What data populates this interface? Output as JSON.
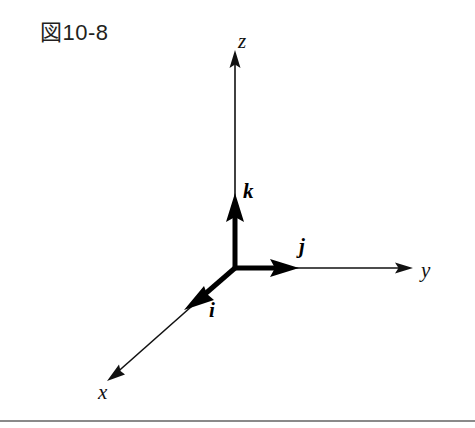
{
  "figure": {
    "caption": "図10-8",
    "background_color": "#ffffff",
    "ink_color": "#111111",
    "caption_color": "#231f20",
    "rule_color": "#8a8a8a"
  },
  "diagram": {
    "type": "3d-coordinate-axes",
    "origin": {
      "x": 235,
      "y": 268
    },
    "axes": [
      {
        "id": "z",
        "label": "z",
        "label_position": {
          "x": 238,
          "y": 48
        },
        "tip": {
          "x": 235,
          "y": 50
        },
        "direction": "up"
      },
      {
        "id": "y",
        "label": "y",
        "label_position": {
          "x": 421,
          "y": 277
        },
        "tip": {
          "x": 413,
          "y": 268
        },
        "direction": "right"
      },
      {
        "id": "x",
        "label": "x",
        "label_position": {
          "x": 98,
          "y": 399
        },
        "tip": {
          "x": 107,
          "y": 381
        },
        "direction": "down-left"
      }
    ],
    "unit_vectors": [
      {
        "id": "k",
        "label": "k",
        "along_axis": "z",
        "label_position": {
          "x": 243,
          "y": 198
        },
        "tip": {
          "x": 235,
          "y": 196
        }
      },
      {
        "id": "j",
        "label": "j",
        "along_axis": "y",
        "label_position": {
          "x": 299,
          "y": 253
        },
        "tip": {
          "x": 297,
          "y": 268
        }
      },
      {
        "id": "i",
        "label": "i",
        "along_axis": "x",
        "label_position": {
          "x": 209,
          "y": 317
        },
        "tip": {
          "x": 186,
          "y": 307
        }
      }
    ]
  }
}
